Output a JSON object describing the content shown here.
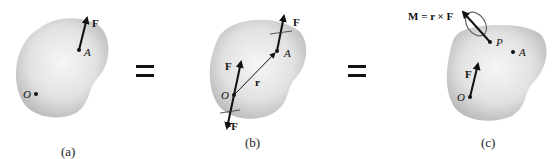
{
  "figure": {
    "panels": [
      {
        "id": "a",
        "caption": "(a)",
        "labels": {
          "force": "F",
          "point_a": "A",
          "origin": "O"
        }
      },
      {
        "id": "b",
        "caption": "(b)",
        "labels": {
          "force_top": "F",
          "point_a": "A",
          "force_mid": "F",
          "position": "r",
          "origin": "O",
          "neg_force": "−F"
        }
      },
      {
        "id": "c",
        "caption": "(c)",
        "labels": {
          "moment_eq": "M = r × F",
          "point_p": "P",
          "point_a": "A",
          "force": "F",
          "origin": "O"
        }
      }
    ],
    "equals_signs": [
      "=",
      "="
    ],
    "colors": {
      "body_fill_center": "#f4f4f4",
      "body_fill_edge": "#b9b9b9",
      "ink": "#111111"
    }
  }
}
